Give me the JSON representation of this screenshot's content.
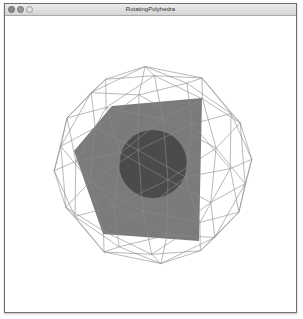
{
  "window": {
    "title": "RotatingPolyhedra",
    "controls": [
      "close",
      "minimize",
      "zoom"
    ]
  },
  "scene": {
    "background": "#ffffff",
    "wireframe": {
      "shape": "geodesic-sphere-wireframe",
      "stroke": "#8a8a8a",
      "center": [
        152,
        164
      ],
      "radius": 100
    },
    "polygon": {
      "shape": "pentagon",
      "fill": "#7b7b7b",
      "vertices": [
        [
          111,
          105
        ],
        [
          201,
          97
        ],
        [
          198,
          240
        ],
        [
          102,
          233
        ],
        [
          73,
          150
        ]
      ]
    },
    "sphere": {
      "shape": "solid-circle",
      "fill": "#4b4b4b",
      "center": [
        152,
        163
      ],
      "radius": 34
    }
  }
}
